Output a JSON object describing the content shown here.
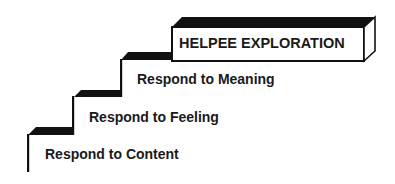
{
  "diagram": {
    "steps": [
      {
        "label": "Respond to Content"
      },
      {
        "label": "Respond to Feeling"
      },
      {
        "label": "Respond to Meaning"
      }
    ],
    "top": {
      "label": "HELPEE EXPLORATION"
    }
  },
  "colors": {
    "ink": "#111111",
    "background": "#ffffff"
  }
}
